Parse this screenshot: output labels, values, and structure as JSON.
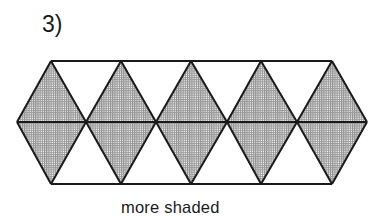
{
  "problem": {
    "number_label": "3)"
  },
  "figure": {
    "shape": "elongated hexagon",
    "colors": {
      "stroke": "#1a1a1a",
      "shade_dot": "#555555",
      "background": "#ffffff"
    },
    "top_vertices_x": [
      51,
      121,
      191,
      261,
      332
    ],
    "bottom_vertices_x": [
      51,
      121,
      191,
      261,
      332
    ],
    "middle_vertices_x": [
      17,
      86,
      156,
      227,
      297,
      367
    ],
    "top_y": 61,
    "middle_y": 122,
    "bottom_y": 184,
    "shaded_diamonds": 5,
    "unshaded_triangles": 8
  },
  "caption": {
    "text": "more shaded"
  }
}
